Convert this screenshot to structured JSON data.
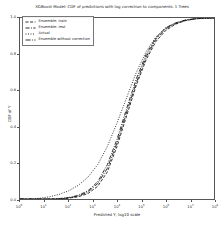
{
  "chart_data": {
    "type": "line",
    "title": "XGBoost Model: CDF of predictions with log correction to components: 1 Trees",
    "xlabel": "Predicted Y, log10 scale",
    "ylabel": "CDF of Y",
    "xscale": "log",
    "xlim": [
      1,
      100000000
    ],
    "ylim": [
      0.0,
      1.0
    ],
    "grid": false,
    "legend_position": "upper left",
    "x_ticks": [
      {
        "label": "10",
        "exp": "0",
        "value": 1
      },
      {
        "label": "10",
        "exp": "1",
        "value": 10
      },
      {
        "label": "10",
        "exp": "2",
        "value": 100
      },
      {
        "label": "10",
        "exp": "3",
        "value": 1000
      },
      {
        "label": "10",
        "exp": "4",
        "value": 10000
      },
      {
        "label": "10",
        "exp": "5",
        "value": 100000
      },
      {
        "label": "10",
        "exp": "6",
        "value": 1000000
      },
      {
        "label": "10",
        "exp": "7",
        "value": 10000000
      },
      {
        "label": "10",
        "exp": "8",
        "value": 100000000
      }
    ],
    "y_ticks": [
      {
        "label": "0.0",
        "value": 0.0
      },
      {
        "label": "0.2",
        "value": 0.2
      },
      {
        "label": "0.4",
        "value": 0.4
      },
      {
        "label": "0.6",
        "value": 0.6
      },
      {
        "label": "0.8",
        "value": 0.8
      },
      {
        "label": "1.0",
        "value": 1.0
      }
    ],
    "x": [
      1,
      2.5,
      6.3,
      16,
      40,
      100,
      250,
      630,
      1600,
      4000,
      10000,
      25000,
      63000,
      160000,
      400000,
      1000000,
      2500000,
      6300000,
      16000000,
      40000000,
      100000000
    ],
    "series": [
      {
        "name": "Ensemble: train",
        "color": "#1a1a1a",
        "style": "solid-dashed",
        "dash": "3,1.6",
        "values": [
          0.0,
          0.0,
          0.0,
          0.0,
          0.0,
          0.005,
          0.012,
          0.03,
          0.07,
          0.15,
          0.29,
          0.46,
          0.63,
          0.77,
          0.87,
          0.93,
          0.965,
          0.985,
          0.995,
          0.999,
          1.0
        ]
      },
      {
        "name": "Ensemble: test",
        "color": "#1a1a1a",
        "style": "dash-dot",
        "dash": "4,1.4,1,1.4",
        "values": [
          0.0,
          0.0,
          0.0,
          0.0,
          0.002,
          0.008,
          0.02,
          0.045,
          0.095,
          0.19,
          0.33,
          0.5,
          0.665,
          0.8,
          0.89,
          0.945,
          0.972,
          0.988,
          0.996,
          0.999,
          1.0
        ]
      },
      {
        "name": "Actual",
        "color": "#1a1a1a",
        "style": "dotted",
        "dash": "1,1.5",
        "values": [
          0.0,
          0.0,
          0.004,
          0.012,
          0.025,
          0.045,
          0.075,
          0.12,
          0.19,
          0.29,
          0.42,
          0.56,
          0.7,
          0.815,
          0.895,
          0.945,
          0.972,
          0.988,
          0.996,
          0.999,
          1.0
        ]
      },
      {
        "name": "Ensemble without correction",
        "color": "#1a1a1a",
        "style": "dash-dot-long",
        "dash": "5,1.4,1,1.4",
        "values": [
          0.0,
          0.0,
          0.0,
          0.0,
          0.001,
          0.006,
          0.016,
          0.038,
          0.085,
          0.17,
          0.31,
          0.48,
          0.645,
          0.785,
          0.882,
          0.94,
          0.968,
          0.986,
          0.995,
          0.999,
          1.0
        ]
      }
    ]
  }
}
